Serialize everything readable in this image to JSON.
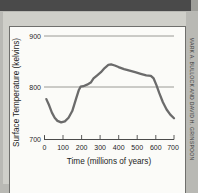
{
  "credit": {
    "text": "MARK A. BULLOCK AND DAVID H. GRINSPOON"
  },
  "chart_data": {
    "type": "line",
    "title": "",
    "xlabel": "Time (millions of years)",
    "ylabel": "Surface Temperature (kelvins)",
    "xlim": [
      0,
      700
    ],
    "ylim": [
      700,
      920
    ],
    "xticks": [
      0,
      100,
      200,
      300,
      400,
      500,
      600,
      700
    ],
    "yticks": [
      700,
      800,
      900
    ],
    "xtick_labels": [
      "0",
      "100",
      "200",
      "300",
      "400",
      "500",
      "600",
      "700"
    ],
    "ytick_labels": [
      "700",
      "800",
      "900"
    ],
    "grid": "horizontal-at-800-and-900",
    "legend": "none",
    "series": [
      {
        "name": "Surface Temperature",
        "color": "#6b6b6b",
        "x": [
          10,
          25,
          40,
          55,
          70,
          90,
          110,
          130,
          150,
          170,
          185,
          195,
          210,
          230,
          250,
          265,
          285,
          305,
          325,
          345,
          360,
          380,
          400,
          430,
          460,
          490,
          520,
          550,
          575,
          590,
          605,
          620,
          640,
          660,
          680,
          700
        ],
        "y": [
          778,
          766,
          752,
          742,
          736,
          733,
          735,
          742,
          755,
          778,
          795,
          802,
          803,
          806,
          810,
          818,
          824,
          830,
          838,
          844,
          845,
          843,
          840,
          836,
          833,
          830,
          827,
          824,
          823,
          818,
          805,
          790,
          772,
          758,
          748,
          741
        ]
      }
    ]
  }
}
